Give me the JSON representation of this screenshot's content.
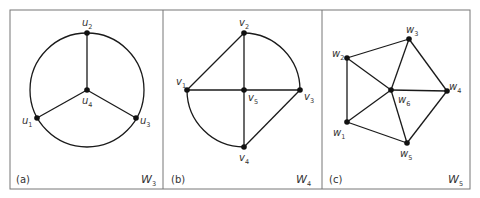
{
  "figure": {
    "frame": {
      "x": 10,
      "y": 10,
      "w": 460,
      "h": 179,
      "dividers": [
        163,
        322
      ]
    },
    "panels": [
      {
        "id": "a",
        "tag": "(a)",
        "tag_pos": [
          16,
          183
        ],
        "name_base": "W",
        "name_sub": "3",
        "name_pos": [
          141,
          183
        ],
        "circle": {
          "cx": 87,
          "cy": 90,
          "r": 57
        },
        "nodes": [
          {
            "id": "u1",
            "base": "u",
            "sub": "1",
            "x": 37,
            "y": 118,
            "lx": 22,
            "ly": 124
          },
          {
            "id": "u2",
            "base": "u",
            "sub": "2",
            "x": 87,
            "y": 33,
            "lx": 82,
            "ly": 26
          },
          {
            "id": "u3",
            "base": "u",
            "sub": "3",
            "x": 136,
            "y": 118,
            "lx": 140,
            "ly": 124
          },
          {
            "id": "u4",
            "base": "u",
            "sub": "4",
            "x": 87,
            "y": 90,
            "lx": 82,
            "ly": 104
          }
        ],
        "edges": [
          [
            "u4",
            "u1"
          ],
          [
            "u4",
            "u2"
          ],
          [
            "u4",
            "u3"
          ]
        ]
      },
      {
        "id": "b",
        "tag": "(b)",
        "tag_pos": [
          171,
          183
        ],
        "name_base": "W",
        "name_sub": "4",
        "name_pos": [
          296,
          183
        ],
        "arcs": [
          {
            "from": [
              244,
              33
            ],
            "to": [
              300,
              90
            ],
            "r": 57,
            "sweep": 1
          },
          {
            "from": [
              187,
              90
            ],
            "to": [
              244,
              147
            ],
            "r": 57,
            "sweep": 0
          }
        ],
        "nodes": [
          {
            "id": "v1",
            "base": "v",
            "sub": "1",
            "x": 187,
            "y": 90,
            "lx": 176,
            "ly": 85
          },
          {
            "id": "v2",
            "base": "v",
            "sub": "2",
            "x": 244,
            "y": 33,
            "lx": 239,
            "ly": 26
          },
          {
            "id": "v3",
            "base": "v",
            "sub": "3",
            "x": 300,
            "y": 90,
            "lx": 304,
            "ly": 100
          },
          {
            "id": "v4",
            "base": "v",
            "sub": "4",
            "x": 244,
            "y": 147,
            "lx": 239,
            "ly": 161
          },
          {
            "id": "v5",
            "base": "v",
            "sub": "5",
            "x": 244,
            "y": 90,
            "lx": 248,
            "ly": 101
          }
        ],
        "edges": [
          [
            "v1",
            "v2"
          ],
          [
            "v1",
            "v5"
          ],
          [
            "v5",
            "v3"
          ],
          [
            "v2",
            "v5"
          ],
          [
            "v5",
            "v4"
          ],
          [
            "v4",
            "v3"
          ]
        ]
      },
      {
        "id": "c",
        "tag": "(c)",
        "tag_pos": [
          329,
          183
        ],
        "name_base": "W",
        "name_sub": "5",
        "name_pos": [
          448,
          183
        ],
        "nodes": [
          {
            "id": "w1",
            "base": "w",
            "sub": "1",
            "x": 347,
            "y": 122,
            "lx": 333,
            "ly": 136
          },
          {
            "id": "w2",
            "base": "w",
            "sub": "2",
            "x": 347,
            "y": 58,
            "lx": 332,
            "ly": 57
          },
          {
            "id": "w3",
            "base": "w",
            "sub": "3",
            "x": 409,
            "y": 39,
            "lx": 406,
            "ly": 33
          },
          {
            "id": "w4",
            "base": "w",
            "sub": "4",
            "x": 447,
            "y": 91,
            "lx": 449,
            "ly": 90
          },
          {
            "id": "w5",
            "base": "w",
            "sub": "5",
            "x": 407,
            "y": 143,
            "lx": 400,
            "ly": 157
          },
          {
            "id": "w6",
            "base": "w",
            "sub": "6",
            "x": 391,
            "y": 90,
            "lx": 398,
            "ly": 103
          }
        ],
        "edges": [
          [
            "w1",
            "w2"
          ],
          [
            "w2",
            "w3"
          ],
          [
            "w3",
            "w4"
          ],
          [
            "w4",
            "w5"
          ],
          [
            "w5",
            "w1"
          ],
          [
            "w6",
            "w1"
          ],
          [
            "w6",
            "w2"
          ],
          [
            "w6",
            "w3"
          ],
          [
            "w6",
            "w4"
          ],
          [
            "w6",
            "w5"
          ]
        ]
      }
    ]
  }
}
